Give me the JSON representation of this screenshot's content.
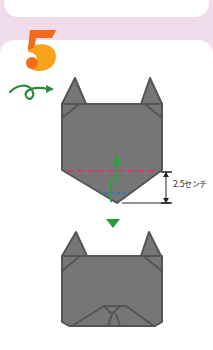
{
  "step": {
    "number": "5",
    "colors": {
      "dark": "#f26a1b",
      "light": "#f7a21b"
    }
  },
  "turn_over_icon": {
    "name": "turn-over-arrow",
    "color": "#2e8b3e"
  },
  "diagram": {
    "paper_color": "#767676",
    "edge_color": "#555555",
    "valley_fold_color": "#d9366e",
    "mountain_fold_color": "#2a7fc4",
    "fold_arrow_color": "#2e9e3e",
    "next_arrow_color": "#2a9a3a",
    "dimension_label": "2.5センチ"
  }
}
